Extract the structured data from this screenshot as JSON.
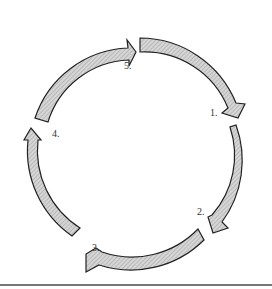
{
  "diagram": {
    "type": "cycle",
    "labels": [
      "1.",
      "2.",
      "3.",
      "4.",
      "5."
    ],
    "arrow_fill": "#c8c8c8",
    "arrow_stroke": "#222222"
  }
}
